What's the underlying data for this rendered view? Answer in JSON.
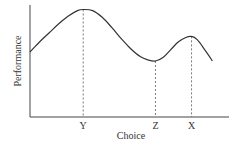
{
  "chart_data": {
    "type": "line",
    "title": "",
    "xlabel": "Choice",
    "ylabel": "Performance",
    "x_tick_labels": [
      "Y",
      "Z",
      "X"
    ],
    "x_ticks": [
      0.28,
      0.66,
      0.85
    ],
    "xlim": [
      0,
      1
    ],
    "ylim": [
      0,
      1
    ],
    "grid": false,
    "series": [
      {
        "name": "Performance curve",
        "x": [
          0.0,
          0.05,
          0.1,
          0.15,
          0.2,
          0.25,
          0.28,
          0.33,
          0.38,
          0.43,
          0.48,
          0.53,
          0.58,
          0.62,
          0.66,
          0.7,
          0.74,
          0.78,
          0.82,
          0.85,
          0.88,
          0.92,
          0.96
        ],
        "y": [
          0.58,
          0.67,
          0.75,
          0.83,
          0.9,
          0.95,
          0.96,
          0.95,
          0.89,
          0.8,
          0.7,
          0.61,
          0.54,
          0.51,
          0.5,
          0.53,
          0.6,
          0.67,
          0.71,
          0.72,
          0.69,
          0.6,
          0.5
        ]
      }
    ],
    "markers": [
      {
        "label": "Y",
        "x": 0.28,
        "y": 0.96
      },
      {
        "label": "Z",
        "x": 0.66,
        "y": 0.5
      },
      {
        "label": "X",
        "x": 0.85,
        "y": 0.72
      }
    ]
  }
}
